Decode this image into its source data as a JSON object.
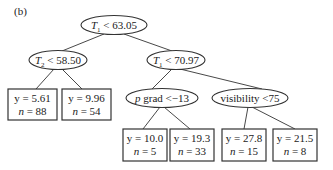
{
  "panel_label": "(b)",
  "tree": {
    "nodes": [
      {
        "id": "root",
        "type": "split",
        "var": "T",
        "sub": "1",
        "op": "<",
        "value": "63.05",
        "cx": 114,
        "cy": 25,
        "rx": 33,
        "ry": 9.5
      },
      {
        "id": "n_t2",
        "type": "split",
        "var": "T",
        "sub": "2",
        "op": "<",
        "value": "58.50",
        "cx": 58,
        "cy": 60,
        "rx": 29,
        "ry": 9.5
      },
      {
        "id": "n_t1b",
        "type": "split",
        "var": "T",
        "sub": "1",
        "op": "<",
        "value": "70.97",
        "cx": 176,
        "cy": 60,
        "rx": 29,
        "ry": 9.5
      },
      {
        "id": "n_pgrad",
        "type": "split",
        "var": "p",
        "label_rest": " grad <−13",
        "cx": 162,
        "cy": 98,
        "rx": 36,
        "ry": 9.5
      },
      {
        "id": "n_vis",
        "type": "split",
        "label": "visibility <75",
        "cx": 250,
        "cy": 98,
        "rx": 38,
        "ry": 9.5
      }
    ],
    "leaves": [
      {
        "id": "leaf1",
        "y_label": "y = 5.61",
        "n_label": "n = 88",
        "x": 8,
        "y": 89,
        "w": 49,
        "h": 31
      },
      {
        "id": "leaf2",
        "y_label": "y = 9.96",
        "n_label": "n = 54",
        "x": 62,
        "y": 89,
        "w": 49,
        "h": 31
      },
      {
        "id": "leaf3",
        "y_label": "y = 10.0",
        "n_label": "n = 5",
        "x": 123,
        "y": 129,
        "w": 44,
        "h": 32
      },
      {
        "id": "leaf4",
        "y_label": "y = 19.3",
        "n_label": "n = 33",
        "x": 170,
        "y": 129,
        "w": 44,
        "h": 32
      },
      {
        "id": "leaf5",
        "y_label": "y = 27.8",
        "n_label": "n = 15",
        "x": 222,
        "y": 129,
        "w": 44,
        "h": 32
      },
      {
        "id": "leaf6",
        "y_label": "y = 21.5",
        "n_label": "n = 8",
        "x": 273,
        "y": 129,
        "w": 44,
        "h": 32
      }
    ],
    "edges": [
      {
        "from": "root",
        "to": "n_t2",
        "x1": 104,
        "y1": 34,
        "x2": 62,
        "y2": 51
      },
      {
        "from": "root",
        "to": "n_t1b",
        "x1": 124,
        "y1": 34,
        "x2": 172,
        "y2": 51
      },
      {
        "from": "n_t2",
        "to": "leaf1",
        "x1": 54,
        "y1": 69,
        "x2": 36,
        "y2": 89
      },
      {
        "from": "n_t2",
        "to": "leaf2",
        "x1": 62,
        "y1": 69,
        "x2": 82,
        "y2": 89
      },
      {
        "from": "n_t1b",
        "to": "n_pgrad",
        "x1": 172,
        "y1": 69,
        "x2": 152,
        "y2": 89
      },
      {
        "from": "n_t1b",
        "to": "n_vis",
        "x1": 180,
        "y1": 69,
        "x2": 262,
        "y2": 89
      },
      {
        "from": "n_pgrad",
        "to": "leaf3",
        "x1": 160,
        "y1": 107,
        "x2": 143,
        "y2": 129
      },
      {
        "from": "n_pgrad",
        "to": "leaf4",
        "x1": 164,
        "y1": 107,
        "x2": 190,
        "y2": 129
      },
      {
        "from": "n_vis",
        "to": "leaf5",
        "x1": 248,
        "y1": 107,
        "x2": 244,
        "y2": 129
      },
      {
        "from": "n_vis",
        "to": "leaf6",
        "x1": 252,
        "y1": 107,
        "x2": 295,
        "y2": 129
      }
    ]
  },
  "colors": {
    "stroke": "#333333",
    "text": "#222222",
    "background": "#ffffff"
  }
}
